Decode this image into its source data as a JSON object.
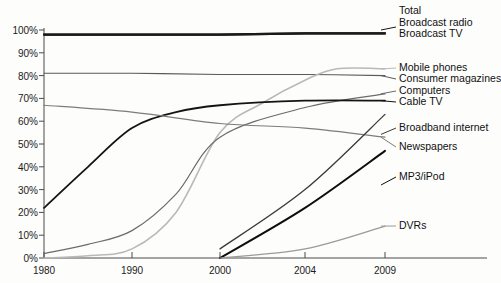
{
  "chart_data": {
    "type": "line",
    "title": "",
    "xlabel": "",
    "ylabel": "",
    "xlim": [
      1980,
      2009
    ],
    "ylim": [
      0,
      100
    ],
    "grid": false,
    "legend_position": "right-inline-labels",
    "x_ticks": [
      "1980",
      "1990",
      "2000",
      "2004",
      "2009"
    ],
    "x_tick_values": [
      1980,
      1990,
      2000,
      2004,
      2009
    ],
    "y_ticks": [
      "0%",
      "10%",
      "20%",
      "30%",
      "40%",
      "50%",
      "60%",
      "70%",
      "80%",
      "90%",
      "100%"
    ],
    "y_tick_values": [
      0,
      10,
      20,
      30,
      40,
      50,
      60,
      70,
      80,
      90,
      100
    ],
    "header_label": "Total",
    "series": [
      {
        "name": "Broadcast radio",
        "color": "#1a1a1a",
        "width": 2.2,
        "points": [
          [
            1980,
            98
          ],
          [
            1990,
            98
          ],
          [
            2000,
            98
          ],
          [
            2004,
            98.5
          ],
          [
            2009,
            98.5
          ]
        ]
      },
      {
        "name": "Broadcast TV",
        "color": "#1a1a1a",
        "width": 2.2,
        "points": [
          [
            1980,
            98
          ],
          [
            1990,
            98
          ],
          [
            2000,
            98
          ],
          [
            2004,
            98.5
          ],
          [
            2009,
            98.5
          ]
        ]
      },
      {
        "name": "Consumer magazines",
        "color": "#5a5a5a",
        "width": 1.1,
        "points": [
          [
            1980,
            81
          ],
          [
            1990,
            81
          ],
          [
            2000,
            80.5
          ],
          [
            2004,
            80.5
          ],
          [
            2009,
            80
          ]
        ]
      },
      {
        "name": "Mobile phones",
        "color": "#b9b9b9",
        "width": 1.6,
        "points": [
          [
            1980,
            0
          ],
          [
            1985,
            1
          ],
          [
            1990,
            4
          ],
          [
            1995,
            20
          ],
          [
            2000,
            55
          ],
          [
            2002,
            68
          ],
          [
            2004,
            78
          ],
          [
            2006,
            83
          ],
          [
            2009,
            83
          ]
        ]
      },
      {
        "name": "Computers",
        "color": "#6b6b6b",
        "width": 1.2,
        "points": [
          [
            1980,
            2
          ],
          [
            1985,
            6
          ],
          [
            1990,
            12
          ],
          [
            1995,
            28
          ],
          [
            2000,
            53
          ],
          [
            2004,
            66
          ],
          [
            2009,
            72
          ]
        ]
      },
      {
        "name": "Cable TV",
        "color": "#141414",
        "width": 1.8,
        "points": [
          [
            1980,
            22
          ],
          [
            1985,
            40
          ],
          [
            1990,
            57
          ],
          [
            1995,
            64
          ],
          [
            2000,
            67
          ],
          [
            2004,
            69
          ],
          [
            2009,
            69
          ]
        ]
      },
      {
        "name": "Newspapers",
        "color": "#7c7c7c",
        "width": 1.2,
        "points": [
          [
            1980,
            67
          ],
          [
            1990,
            64
          ],
          [
            2000,
            59
          ],
          [
            2004,
            57
          ],
          [
            2009,
            53
          ]
        ]
      },
      {
        "name": "Broadband internet",
        "color": "#3a3a3a",
        "width": 1.3,
        "points": [
          [
            2000,
            4
          ],
          [
            2004,
            30
          ],
          [
            2009,
            63
          ]
        ]
      },
      {
        "name": "MP3/iPod",
        "color": "#0e0e0e",
        "width": 2.0,
        "points": [
          [
            2000,
            0
          ],
          [
            2004,
            22
          ],
          [
            2009,
            47
          ]
        ]
      },
      {
        "name": "DVRs",
        "color": "#9a9a9a",
        "width": 1.2,
        "points": [
          [
            2000,
            0
          ],
          [
            2004,
            4
          ],
          [
            2009,
            14
          ]
        ]
      }
    ],
    "annotations": [
      {
        "text": "Total",
        "kind": "group-heading"
      }
    ]
  },
  "labels": {
    "total": "Total",
    "broadcast_radio": "Broadcast radio",
    "broadcast_tv": "Broadcast TV",
    "mobile_phones": "Mobile phones",
    "consumer_magazines": "Consumer magazines",
    "computers": "Computers",
    "cable_tv": "Cable TV",
    "broadband_internet": "Broadband internet",
    "newspapers": "Newspapers",
    "mp3_ipod": "MP3/iPod",
    "dvrs": "DVRs"
  },
  "y_axis": {
    "t100": "100%",
    "t90": "90%",
    "t80": "80%",
    "t70": "70%",
    "t60": "60%",
    "t50": "50%",
    "t40": "40%",
    "t30": "30%",
    "t20": "20%",
    "t10": "10%",
    "t0": "0%"
  },
  "x_axis": {
    "t1980": "1980",
    "t1990": "1990",
    "t2000": "2000",
    "t2004": "2004",
    "t2009": "2009"
  }
}
